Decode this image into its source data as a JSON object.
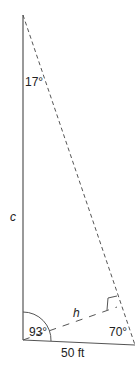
{
  "diagram": {
    "type": "triangle",
    "angles": {
      "top": "17°",
      "bottom_left": "93°",
      "bottom_right": "70°"
    },
    "sides": {
      "left": "c",
      "bottom": "50 ft"
    },
    "height_label": "h",
    "colors": {
      "stroke": "#555555",
      "text": "#222222"
    }
  }
}
